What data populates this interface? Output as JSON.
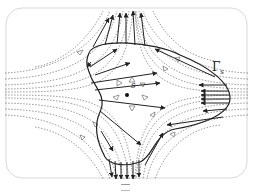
{
  "figure": {
    "type": "flow-field-diagram",
    "contour_label": "Γ",
    "contour_subscript": "s",
    "center_point_label": "s",
    "caption_fragment": "",
    "colors": {
      "frame": "#d9d9d9",
      "streamline": "#555555",
      "contour": "#222222",
      "vector": "#222222",
      "background": "#ffffff"
    },
    "elements": {
      "streamlines": "dotted, with hollow triangular direction markers",
      "boundary_vectors": "solid arrows on contour Γs",
      "center": "filled dot labelled s"
    }
  }
}
